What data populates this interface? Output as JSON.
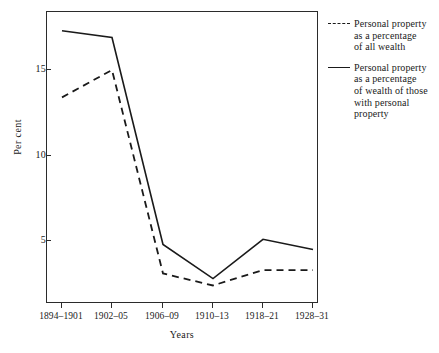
{
  "chart_data": {
    "type": "line",
    "title": "",
    "xlabel": "Years",
    "ylabel": "Per cent",
    "categories": [
      "1894–1901",
      "1902–05",
      "1906–09",
      "1910–13",
      "1918–21",
      "1928–31"
    ],
    "ylim": [
      0,
      18.1
    ],
    "yticks": [
      5,
      10,
      15
    ],
    "ytick_labels": [
      "5",
      "10",
      "15"
    ],
    "grid": false,
    "legend_position": "right",
    "series": [
      {
        "name": "Personal property as a percentage of all wealth",
        "style": "dashed",
        "color": "#1a1a1a",
        "values": [
          13.4,
          15.0,
          3.1,
          2.4,
          3.3,
          3.3
        ]
      },
      {
        "name": "Personal property as a percentage of wealth of those with personal property",
        "style": "solid",
        "color": "#1a1a1a",
        "values": [
          17.3,
          16.9,
          4.8,
          2.8,
          5.1,
          4.5
        ]
      }
    ]
  },
  "axes": {
    "y_title": "Per cent",
    "x_title": "Years",
    "y_tick_labels": [
      "15",
      "10",
      "5"
    ],
    "x_tick_labels": [
      "1894–1901",
      "1902–05",
      "1906–09",
      "1910–13",
      "1918–21",
      "1928–31"
    ]
  },
  "legend": {
    "entries": [
      {
        "marker": "dashed-line-swatch",
        "lines": [
          "Personal property",
          "as a percentage",
          "of all wealth"
        ]
      },
      {
        "marker": "solid-line-swatch",
        "lines": [
          "Personal property",
          "as a percentage",
          "of wealth of those",
          "with personal",
          "property"
        ]
      }
    ]
  },
  "caption": {
    "text": ""
  }
}
